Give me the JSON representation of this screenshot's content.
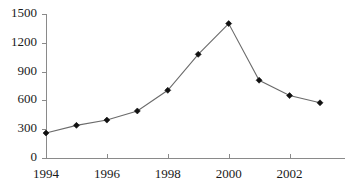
{
  "chart_data": {
    "type": "line",
    "title": "",
    "subtitle": "",
    "xlabel": "",
    "ylabel": "",
    "x": [
      1994,
      1995,
      1996,
      1997,
      1998,
      1999,
      2000,
      2001,
      2002,
      2003
    ],
    "values": [
      260,
      340,
      395,
      490,
      705,
      1080,
      1400,
      810,
      650,
      575
    ],
    "series": [
      {
        "name": "series-1",
        "values": [
          260,
          340,
          395,
          490,
          705,
          1080,
          1400,
          810,
          650,
          575
        ]
      }
    ],
    "xlim": [
      1993.6,
      2003.6
    ],
    "ylim": [
      0,
      1500
    ],
    "xticks": [
      1994,
      1995,
      1996,
      1997,
      1998,
      1999,
      2000,
      2001,
      2002,
      2003
    ],
    "xtick_labels_shown": [
      "1994",
      "1996",
      "1998",
      "2000",
      "2002"
    ],
    "xtick_labels_values": [
      1994,
      1996,
      1998,
      2000,
      2002
    ],
    "yticks": [
      0,
      300,
      600,
      900,
      1200,
      1500
    ],
    "ytick_labels": [
      "0",
      "300",
      "600",
      "900",
      "1200",
      "1500"
    ],
    "grid": false,
    "legend": null,
    "legend_position": "none",
    "marker": "diamond",
    "line_color": "#6b6b6b",
    "marker_color": "#111111",
    "axis_color": "#8a8a8a",
    "text_color": "#1a1a1a",
    "background": "#ffffff"
  },
  "axes": {
    "y_ticks": [
      {
        "label": "1500",
        "value": 1500
      },
      {
        "label": "1200",
        "value": 1200
      },
      {
        "label": "900",
        "value": 900
      },
      {
        "label": "600",
        "value": 600
      },
      {
        "label": "300",
        "value": 300
      },
      {
        "label": "0",
        "value": 0
      }
    ],
    "x_ticks": [
      {
        "label": "1994",
        "value": 1994
      },
      {
        "label": "",
        "value": 1995
      },
      {
        "label": "1996",
        "value": 1996
      },
      {
        "label": "",
        "value": 1997
      },
      {
        "label": "1998",
        "value": 1998
      },
      {
        "label": "",
        "value": 1999
      },
      {
        "label": "2000",
        "value": 2000
      },
      {
        "label": "",
        "value": 2001
      },
      {
        "label": "2002",
        "value": 2002
      },
      {
        "label": "",
        "value": 2003
      }
    ]
  }
}
